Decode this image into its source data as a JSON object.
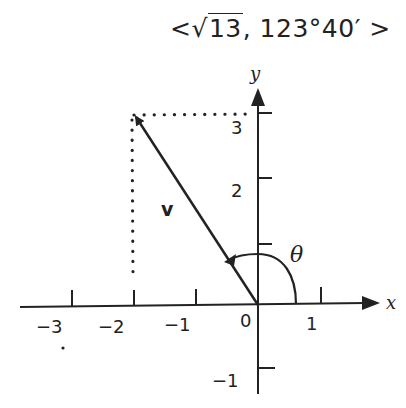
{
  "title": {
    "open": "<",
    "radical": "√",
    "radicand": "13",
    "sep": ",  ",
    "angle": "123°40′",
    "close": ">"
  },
  "axes": {
    "x_label": "x",
    "y_label": "y",
    "x_ticks": [
      "−3",
      "−2",
      "−1",
      "0",
      "1"
    ],
    "y_ticks": [
      "3",
      "2",
      "−1"
    ],
    "origin_label": "0"
  },
  "vector": {
    "label": "v",
    "components": [
      -2,
      3
    ],
    "magnitude": "√13",
    "direction": "123°40′"
  },
  "angle_label": "θ",
  "colors": {
    "ink": "#222222",
    "background": "#ffffff"
  }
}
